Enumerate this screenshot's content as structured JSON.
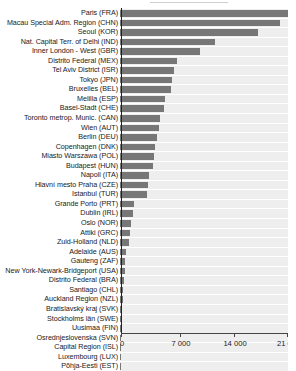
{
  "chart_data": {
    "type": "bar",
    "orientation": "horizontal",
    "title": "",
    "subtitle": "",
    "xlabel": "",
    "ylabel": "",
    "xlim": [
      0,
      21000
    ],
    "grid": true,
    "legend": null,
    "tick_labels": [
      "0",
      "7 000",
      "14 000",
      "21 00"
    ],
    "tick_values": [
      0,
      7000,
      14000,
      21000
    ],
    "bar_color": "#777777",
    "track_color": "#eeeeee",
    "categories": [
      "Paris  (FRA)",
      "Macau Special Adm. Region (CHN)",
      "Seoul  (KOR)",
      "Nat. Capital Terr. of Delhi (IND)",
      "Inner London - West  (GBR)",
      "Distrito Federal (MEX)",
      "Tel Aviv District (ISR)",
      "Tokyo  (JPN)",
      "Bruxelles (BEL)",
      "Melilla (ESP)",
      "Basel-Stadt  (CHE)",
      "Toronto metrop. Munic.  (CAN)",
      "Wien   (AUT)",
      "Berlin  (DEU)",
      "Copenhagen (DNK)",
      "Miasto Warszawa  (POL)",
      "Budapest (HUN)",
      "Napoli  (ITA)",
      "Hlavní mesto Praha   (CZE)",
      "Istanbul  (TUR)",
      "Grande Porto  (PRT)",
      "Dublin  (IRL)",
      "Oslo  (NOR)",
      "Attiki  (GRC)",
      "Zuid-Holland  (NLD)",
      "Adelaide   (AUS)",
      "Gauteng  (ZAF)",
      "New York-Newark-Bridgeport (USA)",
      "Distrito Federal (BRA)",
      "Santiago (CHL)",
      "Auckland Region  (NZL)",
      "Bratislavský kraj  (SVK)",
      "Stockholms län  (SWE)",
      "Uusimaa   (FIN)",
      "Osrednjeslovenska (SVN)",
      "Capital Region  (ISL)",
      "Luxembourg (LUX)",
      "Põhja-Eesti (EST)"
    ],
    "values": [
      20800,
      19100,
      16500,
      11300,
      9600,
      6800,
      6400,
      6200,
      6100,
      5400,
      5200,
      4800,
      4700,
      4400,
      4200,
      4000,
      3900,
      3500,
      3300,
      3200,
      1700,
      1500,
      1300,
      1200,
      1100,
      700,
      650,
      600,
      420,
      350,
      300,
      260,
      230,
      200,
      170,
      150,
      130,
      110
    ]
  }
}
